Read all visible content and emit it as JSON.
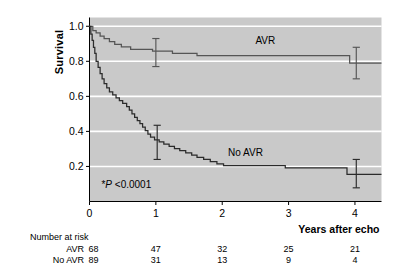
{
  "chart_data": {
    "type": "line",
    "title": "",
    "xlabel": "Years after echo",
    "ylabel": "Survival",
    "xlim": [
      0,
      4.4
    ],
    "ylim": [
      0,
      1.05
    ],
    "grid": true,
    "grid_color": "#ffffff",
    "plot_background": "#c9c9c9",
    "legend_position": "inline-annotation",
    "xticks": [
      0,
      1,
      2,
      3,
      4
    ],
    "xticklabels": [
      "0",
      "1",
      "2",
      "3",
      "4"
    ],
    "yticks": [
      0.2,
      0.4,
      0.6,
      0.8,
      1.0
    ],
    "yticklabels": [
      "0.2",
      "0.4",
      "0.6",
      "0.8",
      "1.0"
    ],
    "annotations": [
      {
        "name": "avr-curve-label",
        "text": "AVR",
        "x": 2.65,
        "y": 0.9
      },
      {
        "name": "no-avr-curve-label",
        "text": "No AVR",
        "x": 2.35,
        "y": 0.26
      },
      {
        "name": "pvalue-note",
        "text": "*P <0.0001",
        "prefix": "*",
        "italic": "P",
        "suffix": " <0.0001",
        "x": 0.18,
        "y": 0.075
      }
    ],
    "series": [
      {
        "name": "AVR",
        "color": "#555555",
        "steps": [
          [
            0.0,
            1.0
          ],
          [
            0.05,
            1.0
          ],
          [
            0.05,
            0.975
          ],
          [
            0.1,
            0.975
          ],
          [
            0.1,
            0.962
          ],
          [
            0.16,
            0.962
          ],
          [
            0.16,
            0.944
          ],
          [
            0.22,
            0.944
          ],
          [
            0.22,
            0.93
          ],
          [
            0.3,
            0.93
          ],
          [
            0.3,
            0.912
          ],
          [
            0.38,
            0.912
          ],
          [
            0.38,
            0.896
          ],
          [
            0.48,
            0.896
          ],
          [
            0.48,
            0.882
          ],
          [
            0.62,
            0.882
          ],
          [
            0.62,
            0.868
          ],
          [
            0.95,
            0.868
          ],
          [
            0.95,
            0.858
          ],
          [
            1.25,
            0.858
          ],
          [
            1.25,
            0.845
          ],
          [
            1.62,
            0.845
          ],
          [
            1.62,
            0.832
          ],
          [
            3.92,
            0.832
          ],
          [
            3.92,
            0.79
          ],
          [
            4.4,
            0.79
          ]
        ],
        "errorbars": [
          {
            "x": 1.0,
            "y": 0.858,
            "low": 0.77,
            "high": 0.93
          },
          {
            "x": 4.02,
            "y": 0.79,
            "low": 0.7,
            "high": 0.88
          }
        ]
      },
      {
        "name": "No AVR",
        "color": "#2b2b2b",
        "steps": [
          [
            0.0,
            1.0
          ],
          [
            0.02,
            1.0
          ],
          [
            0.02,
            0.955
          ],
          [
            0.04,
            0.955
          ],
          [
            0.04,
            0.92
          ],
          [
            0.06,
            0.92
          ],
          [
            0.06,
            0.88
          ],
          [
            0.08,
            0.88
          ],
          [
            0.08,
            0.845
          ],
          [
            0.1,
            0.845
          ],
          [
            0.1,
            0.8
          ],
          [
            0.13,
            0.8
          ],
          [
            0.13,
            0.765
          ],
          [
            0.16,
            0.765
          ],
          [
            0.16,
            0.73
          ],
          [
            0.19,
            0.73
          ],
          [
            0.19,
            0.7
          ],
          [
            0.22,
            0.7
          ],
          [
            0.22,
            0.672
          ],
          [
            0.26,
            0.672
          ],
          [
            0.26,
            0.648
          ],
          [
            0.3,
            0.648
          ],
          [
            0.3,
            0.625
          ],
          [
            0.35,
            0.625
          ],
          [
            0.35,
            0.608
          ],
          [
            0.4,
            0.608
          ],
          [
            0.4,
            0.592
          ],
          [
            0.45,
            0.592
          ],
          [
            0.45,
            0.575
          ],
          [
            0.5,
            0.575
          ],
          [
            0.5,
            0.56
          ],
          [
            0.56,
            0.56
          ],
          [
            0.56,
            0.542
          ],
          [
            0.6,
            0.542
          ],
          [
            0.6,
            0.522
          ],
          [
            0.64,
            0.522
          ],
          [
            0.64,
            0.5
          ],
          [
            0.68,
            0.5
          ],
          [
            0.68,
            0.48
          ],
          [
            0.72,
            0.48
          ],
          [
            0.72,
            0.462
          ],
          [
            0.76,
            0.462
          ],
          [
            0.76,
            0.445
          ],
          [
            0.8,
            0.445
          ],
          [
            0.8,
            0.425
          ],
          [
            0.84,
            0.425
          ],
          [
            0.84,
            0.405
          ],
          [
            0.88,
            0.405
          ],
          [
            0.88,
            0.385
          ],
          [
            0.92,
            0.385
          ],
          [
            0.92,
            0.368
          ],
          [
            0.98,
            0.368
          ],
          [
            0.98,
            0.352
          ],
          [
            1.05,
            0.352
          ],
          [
            1.05,
            0.34
          ],
          [
            1.12,
            0.34
          ],
          [
            1.12,
            0.328
          ],
          [
            1.2,
            0.328
          ],
          [
            1.2,
            0.315
          ],
          [
            1.28,
            0.315
          ],
          [
            1.28,
            0.302
          ],
          [
            1.36,
            0.302
          ],
          [
            1.36,
            0.29
          ],
          [
            1.45,
            0.29
          ],
          [
            1.45,
            0.278
          ],
          [
            1.54,
            0.278
          ],
          [
            1.54,
            0.265
          ],
          [
            1.62,
            0.265
          ],
          [
            1.62,
            0.252
          ],
          [
            1.72,
            0.252
          ],
          [
            1.72,
            0.24
          ],
          [
            1.82,
            0.24
          ],
          [
            1.82,
            0.228
          ],
          [
            1.92,
            0.228
          ],
          [
            1.92,
            0.215
          ],
          [
            2.02,
            0.215
          ],
          [
            2.02,
            0.205
          ],
          [
            2.95,
            0.205
          ],
          [
            2.95,
            0.192
          ],
          [
            3.88,
            0.192
          ],
          [
            3.88,
            0.155
          ],
          [
            4.4,
            0.155
          ]
        ],
        "errorbars": [
          {
            "x": 1.02,
            "y": 0.35,
            "low": 0.24,
            "high": 0.435
          },
          {
            "x": 4.02,
            "y": 0.155,
            "low": 0.078,
            "high": 0.24
          }
        ]
      }
    ]
  },
  "risk_table": {
    "header": "Number at risk",
    "rows": [
      {
        "label": "AVR",
        "values": [
          "68",
          "47",
          "32",
          "25",
          "21"
        ]
      },
      {
        "label": "No AVR",
        "values": [
          "89",
          "31",
          "13",
          "9",
          "4"
        ]
      }
    ],
    "columns_x": [
      0,
      1,
      2,
      3,
      4
    ]
  }
}
